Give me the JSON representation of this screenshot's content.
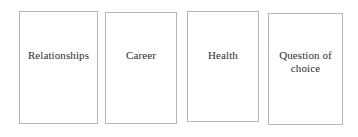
{
  "page": {
    "background_color": "#ffffff",
    "width": 358,
    "height": 137
  },
  "style": {
    "card_border_color": "#b7b7b7",
    "card_fill_color": "#ffffff",
    "label_text_color": "#2c2c2c"
  },
  "cards": [
    {
      "label": "Relationships"
    },
    {
      "label": "Career"
    },
    {
      "label": "Health"
    },
    {
      "label": "Question of choice"
    }
  ]
}
